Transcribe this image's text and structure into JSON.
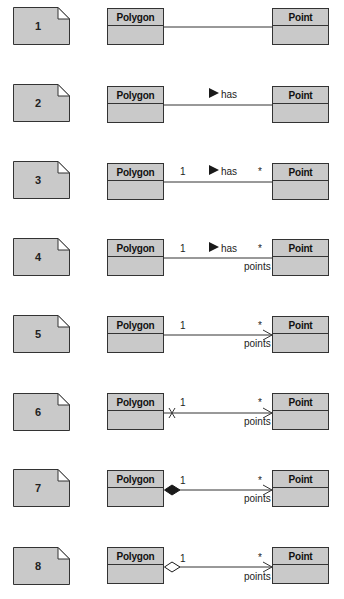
{
  "diagram": {
    "type": "UML class association variants",
    "rows": [
      {
        "note": "1",
        "source": "Polygon",
        "target": "Point",
        "name": "",
        "source_mult": "",
        "target_mult": "",
        "role": "",
        "navigable": false,
        "non_navigable_source": false,
        "aggregation": "none"
      },
      {
        "note": "2",
        "source": "Polygon",
        "target": "Point",
        "name": "has",
        "source_mult": "",
        "target_mult": "",
        "role": "",
        "navigable": false,
        "non_navigable_source": false,
        "aggregation": "none"
      },
      {
        "note": "3",
        "source": "Polygon",
        "target": "Point",
        "name": "has",
        "source_mult": "1",
        "target_mult": "*",
        "role": "",
        "navigable": false,
        "non_navigable_source": false,
        "aggregation": "none"
      },
      {
        "note": "4",
        "source": "Polygon",
        "target": "Point",
        "name": "has",
        "source_mult": "1",
        "target_mult": "*",
        "role": "points",
        "navigable": false,
        "non_navigable_source": false,
        "aggregation": "none"
      },
      {
        "note": "5",
        "source": "Polygon",
        "target": "Point",
        "name": "",
        "source_mult": "1",
        "target_mult": "*",
        "role": "points",
        "navigable": true,
        "non_navigable_source": false,
        "aggregation": "none"
      },
      {
        "note": "6",
        "source": "Polygon",
        "target": "Point",
        "name": "",
        "source_mult": "1",
        "target_mult": "*",
        "role": "points",
        "navigable": true,
        "non_navigable_source": true,
        "aggregation": "none"
      },
      {
        "note": "7",
        "source": "Polygon",
        "target": "Point",
        "name": "",
        "source_mult": "1",
        "target_mult": "*",
        "role": "points",
        "navigable": true,
        "non_navigable_source": false,
        "aggregation": "composition"
      },
      {
        "note": "8",
        "source": "Polygon",
        "target": "Point",
        "name": "",
        "source_mult": "1",
        "target_mult": "*",
        "role": "points",
        "navigable": true,
        "non_navigable_source": false,
        "aggregation": "shared"
      }
    ]
  },
  "colors": {
    "class_fill": "#c9c9c9",
    "note_fill": "#c9c9c9",
    "line": "#333333",
    "background": "#ffffff"
  }
}
